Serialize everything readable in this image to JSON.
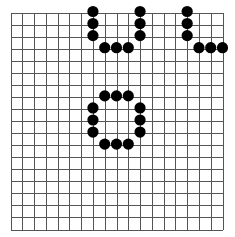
{
  "board": {
    "lines": 19,
    "line_color": "#555555",
    "background": "#ffffff",
    "stone_color": "#000000",
    "stones": [
      {
        "col": 7,
        "row": 0
      },
      {
        "col": 7,
        "row": 1
      },
      {
        "col": 7,
        "row": 2
      },
      {
        "col": 8,
        "row": 3
      },
      {
        "col": 9,
        "row": 3
      },
      {
        "col": 10,
        "row": 3
      },
      {
        "col": 11,
        "row": 0
      },
      {
        "col": 11,
        "row": 1
      },
      {
        "col": 11,
        "row": 2
      },
      {
        "col": 15,
        "row": 0
      },
      {
        "col": 15,
        "row": 1
      },
      {
        "col": 15,
        "row": 2
      },
      {
        "col": 16,
        "row": 3
      },
      {
        "col": 17,
        "row": 3
      },
      {
        "col": 18,
        "row": 3
      },
      {
        "col": 8,
        "row": 7
      },
      {
        "col": 9,
        "row": 7
      },
      {
        "col": 10,
        "row": 7
      },
      {
        "col": 7,
        "row": 8
      },
      {
        "col": 7,
        "row": 9
      },
      {
        "col": 7,
        "row": 10
      },
      {
        "col": 11,
        "row": 8
      },
      {
        "col": 11,
        "row": 9
      },
      {
        "col": 11,
        "row": 10
      },
      {
        "col": 8,
        "row": 11
      },
      {
        "col": 9,
        "row": 11
      },
      {
        "col": 10,
        "row": 11
      }
    ]
  }
}
